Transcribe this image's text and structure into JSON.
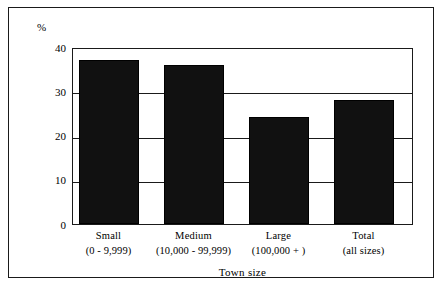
{
  "chart_data": {
    "type": "bar",
    "title": "",
    "subtitle": "",
    "xlabel": "Town size",
    "ylabel": "%",
    "unit_label": "%",
    "categories": [
      "Small",
      "Medium",
      "Large",
      "Total"
    ],
    "category_sublabels": [
      "(0 - 9,999)",
      "(10,000 - 99,999)",
      "(100,000 + )",
      "(all sizes)"
    ],
    "values": [
      37.5,
      36.3,
      24.5,
      28.3
    ],
    "ylim": [
      0,
      40
    ],
    "yticks": [
      40,
      30,
      20,
      10,
      0
    ],
    "ytick_labels": [
      "40",
      "30",
      "20",
      "10",
      "0"
    ],
    "grid": true,
    "legend": "none",
    "bar_color": "#111111",
    "frame_color": "#1a1a1a",
    "background_color": "#ffffff"
  },
  "figure": {
    "outer_border": true,
    "axis_unit": "%"
  }
}
